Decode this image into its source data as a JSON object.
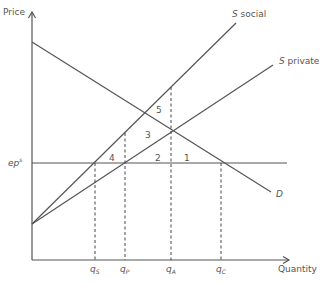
{
  "axes": {
    "y_label": "Price",
    "x_label": "Quantity"
  },
  "price_line": {
    "label_main": "ep",
    "label_sup": "s"
  },
  "curves": {
    "s_social": {
      "italic": "S",
      "rest": " social"
    },
    "s_private": {
      "italic": "S",
      "rest": " private"
    },
    "demand": {
      "label": "D"
    }
  },
  "quantities": [
    {
      "main": "q",
      "sub": "S"
    },
    {
      "main": "q",
      "sub": "P"
    },
    {
      "main": "q",
      "sub": "A"
    },
    {
      "main": "q",
      "sub": "C"
    }
  ],
  "regions": [
    "1",
    "2",
    "3",
    "4",
    "5"
  ],
  "colors": {
    "line": "#555555",
    "background": "#ffffff"
  }
}
